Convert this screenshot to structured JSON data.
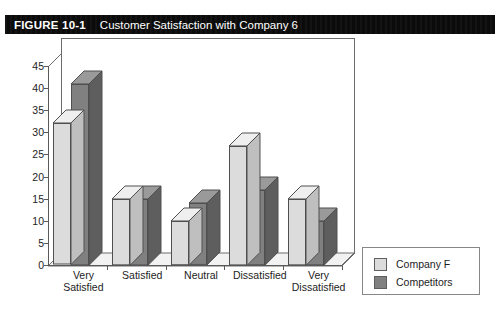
{
  "figure": {
    "number": "FIGURE 10-1",
    "title": "Customer Satisfaction with Company 6"
  },
  "colors": {
    "series_company_f": "#DCDCDC",
    "series_company_f_side": "#BFBFBF",
    "series_company_f_top": "#EFEFEF",
    "series_competitors": "#808080",
    "series_competitors_side": "#5E5E5E",
    "series_competitors_top": "#9A9A9A",
    "header_bar": "#0B0B0B",
    "axis": "#5A5A5A",
    "text": "#1D1D1D"
  },
  "chart_data": {
    "type": "bar",
    "title": "Customer Satisfaction with Company 6",
    "xlabel": "",
    "ylabel": "",
    "ylim": [
      0,
      45
    ],
    "yticks": [
      0,
      5,
      10,
      15,
      20,
      25,
      30,
      35,
      40,
      45
    ],
    "ytick_labels": [
      "0",
      "5",
      "10",
      "15",
      "20",
      "25",
      "30",
      "35",
      "40",
      "45"
    ],
    "grid": false,
    "legend_position": "right",
    "three_d": true,
    "categories": [
      "Very\nSatisfied",
      "Satisfied",
      "Neutral",
      "Dissatisfied",
      "Very\nDissatisfied"
    ],
    "category_labels": [
      [
        "Very",
        "Satisfied"
      ],
      [
        "Satisfied",
        ""
      ],
      [
        "Neutral",
        ""
      ],
      [
        "Dissatisfied",
        ""
      ],
      [
        "Very",
        "Dissatisfied"
      ]
    ],
    "series": [
      {
        "name": "Company F",
        "color": "#DCDCDC",
        "values": [
          32,
          15,
          10,
          27,
          15
        ]
      },
      {
        "name": "Competitors",
        "color": "#808080",
        "values": [
          41,
          15,
          14,
          17,
          10
        ]
      }
    ]
  },
  "legend": {
    "items": [
      {
        "label": "Company F"
      },
      {
        "label": "Competitors"
      }
    ]
  }
}
